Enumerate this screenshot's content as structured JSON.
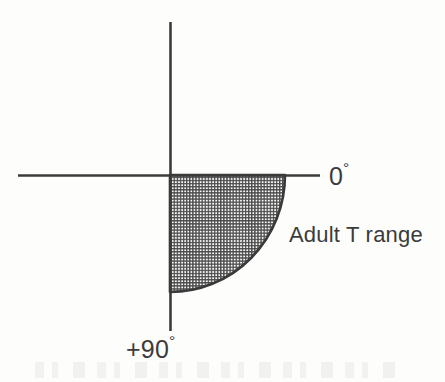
{
  "figure": {
    "background_color": "#fdfdfc",
    "ink_color": "#3b3b3b"
  },
  "labels": {
    "axis_right": {
      "value": "0",
      "degree_symbol": "°",
      "full": "0°"
    },
    "axis_bottom": {
      "value": "+90",
      "degree_symbol": "°",
      "full": "+90°"
    },
    "annotation": "Adult T range"
  },
  "chart_data": {
    "type": "area",
    "title": "Adult T range",
    "xlabel": "",
    "ylabel": "",
    "axes": {
      "horizontal": {
        "x_start": 18,
        "x_end": 320,
        "y": 175,
        "label_right": "0°"
      },
      "vertical": {
        "y_start": 22,
        "y_end": 331,
        "x": 170,
        "label_bottom": "+90°"
      },
      "origin": {
        "x": 170,
        "y": 175
      }
    },
    "region": {
      "name": "Adult T range",
      "shape": "quarter-ellipse",
      "quadrant": "lower-right",
      "fill": "cross-hatch-grid",
      "fill_color": "#4a4a4a",
      "angle_range_deg": [
        0,
        90
      ],
      "radius_x": 115,
      "radius_y": 117,
      "corner": {
        "x": 170,
        "y": 175
      },
      "arc_start": {
        "x": 285,
        "y": 175
      },
      "arc_end": {
        "x": 170,
        "y": 292
      }
    },
    "legend": {
      "position": "right",
      "entries": [
        "Adult T range"
      ]
    },
    "grid": false
  }
}
